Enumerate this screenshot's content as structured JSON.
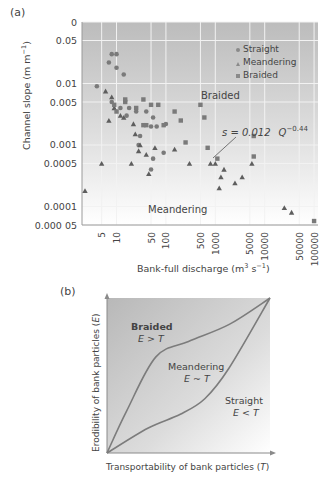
{
  "chart_data": [
    {
      "panel": "(a)",
      "type": "scatter",
      "xscale": "log",
      "yscale": "log",
      "xlabel": "Bank-full discharge (m³ s⁻¹)",
      "ylabel": "Channel slope (m m⁻¹)",
      "xlim": [
        2,
        120000
      ],
      "ylim": [
        5e-05,
        0.1
      ],
      "x_ticks": [
        5,
        10,
        50,
        100,
        500,
        1000,
        5000,
        10000,
        50000,
        100000
      ],
      "x_tick_labels": [
        "5",
        "10",
        "50",
        "100",
        "500",
        "1000",
        "5000",
        "10000",
        "50000",
        "100000"
      ],
      "y_ticks": [
        0.1,
        0.05,
        0.01,
        0.005,
        0.001,
        0.0005,
        0.0001,
        5e-05
      ],
      "y_tick_labels": [
        "0",
        "0.05",
        "0.01",
        "0.005",
        "0.001",
        "0.0005",
        "0.0001",
        "0.000 05"
      ],
      "grid": true,
      "legend": {
        "position": "upper right",
        "entries": [
          "Straight",
          "Meandering",
          "Braided"
        ]
      },
      "annotations": [
        {
          "text": "Braided",
          "x": 1500,
          "y": 0.006
        },
        {
          "text": "Meandering",
          "x": 200,
          "y": 0.00022
        },
        {
          "text": "s = 0.012  Q",
          "superscript": "−0.44",
          "x": 1000,
          "y": 0.0015
        }
      ],
      "threshold_line": {
        "label": "s = 0.012 Q^-0.44",
        "coef": 0.012,
        "exponent": -0.44
      },
      "series": [
        {
          "name": "Straight",
          "marker": "circle",
          "points": [
            [
              8,
              0.03
            ],
            [
              10,
              0.03
            ],
            [
              7,
              0.022
            ],
            [
              10,
              0.018
            ],
            [
              14,
              0.014
            ],
            [
              4,
              0.009
            ],
            [
              8,
              0.005
            ],
            [
              12,
              0.004
            ],
            [
              18,
              0.004
            ],
            [
              16,
              0.003
            ],
            [
              25,
              0.0035
            ],
            [
              40,
              0.0035
            ],
            [
              55,
              0.0028
            ],
            [
              50,
              0.002
            ],
            [
              65,
              0.002
            ],
            [
              100,
              0.0022
            ],
            [
              30,
              0.0014
            ],
            [
              28,
              0.001
            ],
            [
              55,
              0.0006
            ],
            [
              50,
              0.0004
            ],
            [
              90,
              0.00075
            ]
          ]
        },
        {
          "name": "Meandering",
          "marker": "triangle",
          "points": [
            [
              6,
              0.0075
            ],
            [
              8,
              0.006
            ],
            [
              9,
              0.004
            ],
            [
              7,
              0.0025
            ],
            [
              12,
              0.003
            ],
            [
              14,
              0.0028
            ],
            [
              22,
              0.0022
            ],
            [
              24,
              0.0015
            ],
            [
              30,
              0.001
            ],
            [
              28,
              0.0008
            ],
            [
              40,
              0.0007
            ],
            [
              60,
              0.0009
            ],
            [
              5,
              0.0005
            ],
            [
              20,
              0.0005
            ],
            [
              2.3,
              0.00018
            ],
            [
              45,
              0.00034
            ],
            [
              150,
              0.00085
            ],
            [
              300,
              0.0005
            ],
            [
              800,
              0.0005
            ],
            [
              1000,
              0.0005
            ],
            [
              1500,
              0.0004
            ],
            [
              5500,
              0.0005
            ],
            [
              1300,
              0.0003
            ],
            [
              2500,
              0.00024
            ],
            [
              3500,
              0.0003
            ],
            [
              1200,
              0.0002
            ],
            [
              25000,
              9.5e-05
            ],
            [
              35000,
              8e-05
            ]
          ]
        },
        {
          "name": "Braided",
          "marker": "square",
          "points": [
            [
              9,
              0.0045
            ],
            [
              15,
              0.005
            ],
            [
              25,
              0.004
            ],
            [
              35,
              0.0055
            ],
            [
              50,
              0.0045
            ],
            [
              70,
              0.0045
            ],
            [
              200,
              0.0025
            ],
            [
              150,
              0.0035
            ],
            [
              10,
              0.0035
            ],
            [
              35,
              0.0021
            ],
            [
              40,
              0.0021
            ],
            [
              90,
              0.0021
            ],
            [
              500,
              0.0045
            ],
            [
              600,
              0.0028
            ],
            [
              700,
              0.0009
            ],
            [
              1100,
              0.0006
            ],
            [
              6000,
              0.0014
            ],
            [
              6000,
              0.00065
            ],
            [
              100000,
              5.8e-05
            ],
            [
              250,
              0.0011
            ],
            [
              15,
              0.0055
            ]
          ]
        }
      ]
    },
    {
      "panel": "(b)",
      "type": "line",
      "xlabel": "Transportability of bank particles (T)",
      "ylabel": "Erodibility of bank particles (E)",
      "regions": [
        {
          "name": "Braided",
          "relation": "E > T"
        },
        {
          "name": "Meandering",
          "relation": "E ~ T"
        },
        {
          "name": "Straight",
          "relation": "E < T"
        }
      ],
      "curves": [
        {
          "name": "upper boundary",
          "points": [
            [
              0,
              0
            ],
            [
              0.12,
              0.27
            ],
            [
              0.3,
              0.62
            ],
            [
              0.5,
              0.72
            ],
            [
              0.75,
              0.83
            ],
            [
              1,
              1
            ]
          ]
        },
        {
          "name": "lower boundary",
          "points": [
            [
              0,
              0
            ],
            [
              0.25,
              0.16
            ],
            [
              0.45,
              0.25
            ],
            [
              0.6,
              0.35
            ],
            [
              0.75,
              0.55
            ],
            [
              1,
              1
            ]
          ]
        }
      ],
      "grid": false
    }
  ],
  "labels": {
    "panel_a": "(a)",
    "panel_b": "(b)",
    "a_xlabel": "Bank-full discharge (m",
    "a_xlabel_sup": "3",
    "a_xlabel_mid": " s",
    "a_xlabel_sup2": "−1",
    "a_xlabel_end": ")",
    "a_ylabel": "Channel slope (m m",
    "a_ylabel_sup": "−1",
    "a_ylabel_end": ")",
    "legend_straight": "Straight",
    "legend_meandering": "Meandering",
    "legend_braided": "Braided",
    "region_braided": "Braided",
    "region_meandering": "Meandering",
    "eq_main": "s = 0.012",
    "eq_q": "Q",
    "eq_exp": "−0.44",
    "b_xlabel": "Transportability of bank particles (",
    "b_xlabel_var": "T",
    "b_xlabel_end": ")",
    "b_ylabel": "Erodibility of bank particles (",
    "b_ylabel_var": "E",
    "b_ylabel_end": ")",
    "b_braided": "Braided",
    "b_braided_rel": "E > T",
    "b_meandering": "Meandering",
    "b_meandering_rel": "E ~ T",
    "b_straight": "Straight",
    "b_straight_rel": "E < T"
  },
  "colors": {
    "plot_bg_top": "#bdbdbd",
    "plot_bg_bottom": "#ffffff",
    "grid": "#f2f2f2",
    "marker": "#7a7a7a",
    "curve": "#7c7c7c",
    "axis": "#9a9a9a",
    "text": "#333333"
  }
}
